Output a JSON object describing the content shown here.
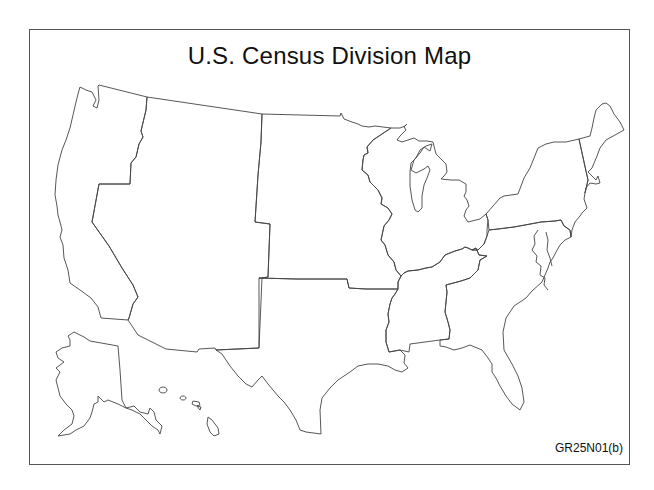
{
  "map": {
    "title": "U.S. Census Division Map",
    "figure_code": "GR25N01(b)",
    "divisions": [
      {
        "name": "Pacific",
        "id": "pacific"
      },
      {
        "name": "Mountain",
        "id": "mountain"
      },
      {
        "name": "West North Central",
        "id": "west-north-central"
      },
      {
        "name": "East North Central",
        "id": "east-north-central"
      },
      {
        "name": "Middle Atlantic",
        "id": "middle-atlantic"
      },
      {
        "name": "New England",
        "id": "new-england"
      },
      {
        "name": "South Atlantic",
        "id": "south-atlantic"
      },
      {
        "name": "East South Central",
        "id": "east-south-central"
      },
      {
        "name": "West South Central",
        "id": "west-south-central"
      }
    ],
    "insets": [
      "Alaska",
      "Hawaii"
    ],
    "stroke_color": "#444444",
    "frame_color": "#555555"
  }
}
